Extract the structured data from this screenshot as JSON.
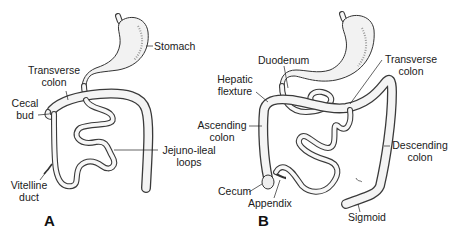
{
  "figure": {
    "panels": [
      {
        "id": "A",
        "label": "A",
        "structures": {
          "stomach": "Stomach",
          "transverse_colon_line1": "Transverse",
          "transverse_colon_line2": "colon",
          "cecal_bud_line1": "Cecal",
          "cecal_bud_line2": "bud",
          "jejuno_ileal_line1": "Jejuno-ileal",
          "jejuno_ileal_line2": "loops",
          "vitelline_line1": "Vitelline",
          "vitelline_line2": "duct"
        }
      },
      {
        "id": "B",
        "label": "B",
        "structures": {
          "duodenum": "Duodenum",
          "transverse_colon_line1": "Transverse",
          "transverse_colon_line2": "colon",
          "hepatic_line1": "Hepatic",
          "hepatic_line2": "flexture",
          "ascending_line1": "Ascending",
          "ascending_line2": "colon",
          "descending_line1": "Descending",
          "descending_line2": "colon",
          "cecum": "Cecum",
          "appendix": "Appendix",
          "sigmoid": "Sigmoid"
        }
      }
    ]
  }
}
